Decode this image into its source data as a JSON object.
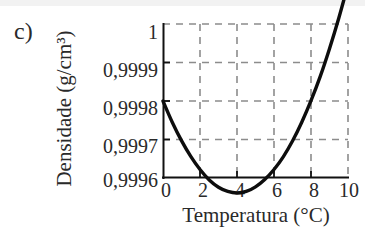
{
  "figure": {
    "panel_letter": "c)",
    "background_color": "#ffffff",
    "curve_color": "#0d0d0d",
    "grid_color": "#8c8c8c",
    "axis_color": "#111111"
  },
  "chart_data": {
    "type": "line",
    "title": "",
    "subtitle": "",
    "xlabel": "Temperatura (°C)",
    "ylabel": "Densidade (g/cm³)",
    "xlim": [
      0,
      10
    ],
    "ylim": [
      0.9996,
      1
    ],
    "xticks": [
      0,
      2,
      4,
      6,
      8,
      10
    ],
    "xtick_labels": [
      "0",
      "2",
      "4",
      "6",
      "8",
      "10"
    ],
    "yticks": [
      0.9996,
      0.9997,
      0.9998,
      0.9999,
      1
    ],
    "ytick_labels": [
      "0,9996",
      "0,9997",
      "0,9998",
      "0,9999",
      "1"
    ],
    "grid": true,
    "grid_style": "dashed",
    "legend": null,
    "series": [
      {
        "name": "Densidade da água",
        "x": [
          0,
          0.5,
          1,
          1.5,
          2,
          2.5,
          3,
          3.5,
          4,
          4.5,
          5,
          5.5,
          6,
          6.5,
          7,
          7.5,
          8,
          8.5,
          9,
          9.5,
          10
        ],
        "y": [
          0.9998,
          0.999745,
          0.999697,
          0.999656,
          0.999622,
          0.999595,
          0.999576,
          0.999565,
          0.999561,
          0.999565,
          0.999577,
          0.999596,
          0.999622,
          0.999655,
          0.999696,
          0.999745,
          0.999801,
          0.999864,
          0.999936,
          1.000015,
          1.000102
        ]
      }
    ],
    "annotations": []
  }
}
